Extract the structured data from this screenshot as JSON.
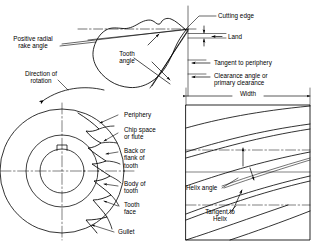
{
  "diagram": {
    "background_color": "#ffffff",
    "line_color": "#000000",
    "views": [
      {
        "id": "tooth-detail-view",
        "name": "enlarged tooth detail",
        "position": "top-center"
      },
      {
        "id": "cutter-end-view",
        "name": "end view of milling cutter",
        "position": "bottom-left"
      },
      {
        "id": "helix-side-view",
        "name": "side / developed view showing helix",
        "position": "right"
      }
    ]
  },
  "labels": {
    "positive_radial_rake_angle": "Positive radial\nrake angle",
    "direction_of_rotation": "Direction of\nrotation",
    "tooth_angle": "Tooth\nangle",
    "cutting_edge": "Cutting edge",
    "land": "Land",
    "tangent_to_periphery": "Tangent to periphery",
    "clearance_angle": "Clearance angle or\nprimary clearance",
    "width": "Width",
    "periphery": "Periphery",
    "chip_space_or_flute": "Chip space\nor flute",
    "back_or_flank_of_tooth": "Back or\nflank of\ntooth",
    "body_of_tooth": "Body of\ntooth",
    "tooth_face": "Tooth\nface",
    "gullet": "Gullet",
    "helix_angle": "Helix angle",
    "tangent_to_helix": "Tangent to\nHelix"
  }
}
